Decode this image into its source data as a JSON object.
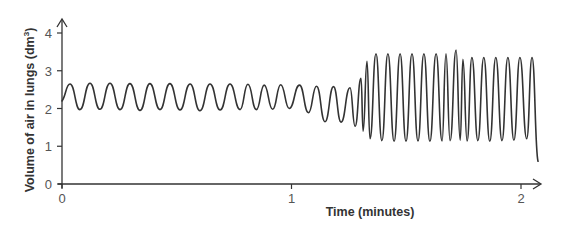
{
  "chart_data": {
    "type": "line",
    "title": "",
    "xlabel": "Time (minutes)",
    "ylabel": "Volume of air in lungs (dm³)",
    "xlim": [
      0,
      2.1
    ],
    "ylim": [
      0,
      4.2
    ],
    "x_ticks": [
      0,
      1,
      2
    ],
    "y_ticks": [
      0,
      1,
      2,
      3,
      4
    ],
    "grid": false,
    "legend": null,
    "series": [
      {
        "name": "Lung volume",
        "color": "#333333",
        "points": [
          [
            0.0,
            2.2
          ],
          [
            0.035,
            2.65
          ],
          [
            0.078,
            1.97
          ],
          [
            0.122,
            2.67
          ],
          [
            0.165,
            1.98
          ],
          [
            0.209,
            2.67
          ],
          [
            0.253,
            1.97
          ],
          [
            0.296,
            2.66
          ],
          [
            0.34,
            1.95
          ],
          [
            0.383,
            2.66
          ],
          [
            0.427,
            1.97
          ],
          [
            0.47,
            2.66
          ],
          [
            0.514,
            1.96
          ],
          [
            0.558,
            2.65
          ],
          [
            0.601,
            1.94
          ],
          [
            0.645,
            2.65
          ],
          [
            0.689,
            1.96
          ],
          [
            0.732,
            2.65
          ],
          [
            0.776,
            1.97
          ],
          [
            0.81,
            2.64
          ],
          [
            0.847,
            1.97
          ],
          [
            0.881,
            2.62
          ],
          [
            0.918,
            1.98
          ],
          [
            0.953,
            2.63
          ],
          [
            0.99,
            2.0
          ],
          [
            1.035,
            2.62
          ],
          [
            1.074,
            1.89
          ],
          [
            1.109,
            2.59
          ],
          [
            1.146,
            1.65
          ],
          [
            1.183,
            2.58
          ],
          [
            1.216,
            1.64
          ],
          [
            1.255,
            2.55
          ],
          [
            1.277,
            1.53
          ],
          [
            1.303,
            2.8
          ],
          [
            1.312,
            1.4
          ],
          [
            1.329,
            3.25
          ],
          [
            1.342,
            1.2
          ],
          [
            1.368,
            3.45
          ],
          [
            1.394,
            1.15
          ],
          [
            1.42,
            3.45
          ],
          [
            1.447,
            1.13
          ],
          [
            1.473,
            3.45
          ],
          [
            1.499,
            1.13
          ],
          [
            1.525,
            3.45
          ],
          [
            1.551,
            1.14
          ],
          [
            1.577,
            3.45
          ],
          [
            1.603,
            1.13
          ],
          [
            1.63,
            3.45
          ],
          [
            1.656,
            1.14
          ],
          [
            1.673,
            3.45
          ],
          [
            1.691,
            1.15
          ],
          [
            1.717,
            3.55
          ],
          [
            1.735,
            1.16
          ],
          [
            1.747,
            3.3
          ],
          [
            1.765,
            1.14
          ],
          [
            1.786,
            3.35
          ],
          [
            1.812,
            1.15
          ],
          [
            1.838,
            3.35
          ],
          [
            1.864,
            1.13
          ],
          [
            1.89,
            3.35
          ],
          [
            1.917,
            1.15
          ],
          [
            1.943,
            3.35
          ],
          [
            1.969,
            1.16
          ],
          [
            1.995,
            3.35
          ],
          [
            2.025,
            1.2
          ],
          [
            2.048,
            3.35
          ],
          [
            2.074,
            0.6
          ]
        ]
      }
    ]
  },
  "axes": {
    "x_title": "Time (minutes)",
    "y_title_main": "Volume of air in lungs (dm",
    "y_title_sup": "3",
    "y_title_close": ")",
    "x_tick_labels": [
      "0",
      "1",
      "2"
    ],
    "y_tick_labels": [
      "0",
      "1",
      "2",
      "3",
      "4"
    ]
  }
}
